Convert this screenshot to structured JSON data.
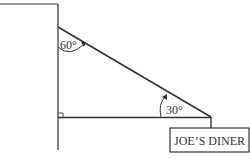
{
  "diagram": {
    "angles": {
      "top": "60°",
      "bottom": "30°"
    },
    "sign": "JOE’S DINER",
    "colors": {
      "line": "#333333",
      "background": "#ffffff"
    }
  }
}
